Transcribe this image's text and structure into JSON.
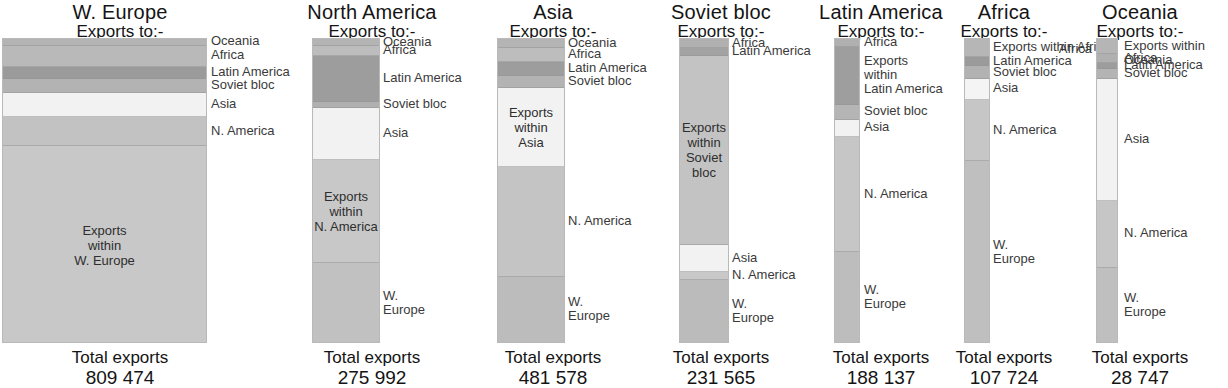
{
  "figure": {
    "subtitle_text": "Exports to:-",
    "total_label": "Total exports"
  },
  "chart_data": {
    "type": "bar",
    "subtitle": "Exports to:-",
    "xlabel": "",
    "ylabel": "",
    "stacked": true,
    "normalized": true,
    "legend": "inline-callouts",
    "grid": false,
    "categories": [
      "W. Europe",
      "North America",
      "Asia",
      "Soviet bloc",
      "Latin America",
      "Africa",
      "Oceania"
    ],
    "totals": [
      809474,
      275992,
      481578,
      231565,
      188137,
      107724,
      28747
    ],
    "totals_display": [
      "809 474",
      "275 992",
      "481 578",
      "231 565",
      "188 137",
      "107 724",
      "28 747"
    ],
    "destination_order": [
      "Oceania",
      "Africa",
      "Latin America",
      "Soviet bloc",
      "Asia",
      "N. America",
      "W. Europe"
    ],
    "colors": {
      "oceania": "#b0b0b0",
      "africa": "#b9b9b9",
      "latin_america": "#9a9a9a",
      "soviet_bloc": "#b5b5b5",
      "asia": "#f0f0f0",
      "n_america": "#c4c4c4",
      "w_europe": "#c0c0c0",
      "within": "#c8c8c8",
      "outline": "#b9b9b9",
      "text": "#141414"
    },
    "panels": [
      {
        "name": "W. Europe",
        "title": "W. Europe",
        "total": "809 474",
        "segments": [
          {
            "dest": "Oceania",
            "pct": 2.2,
            "color": "#b4b4b4",
            "callout": "Oceania",
            "side": "right",
            "inner": null
          },
          {
            "dest": "Africa",
            "pct": 7.0,
            "color": "#b9b9b9",
            "callout": "Africa",
            "side": "right",
            "inner": null
          },
          {
            "dest": "Latin America",
            "pct": 4.0,
            "color": "#9b9b9b",
            "callout": "Latin America",
            "side": "right",
            "inner": null
          },
          {
            "dest": "Soviet bloc",
            "pct": 4.5,
            "color": "#b3b3b3",
            "callout": "Soviet bloc",
            "side": "right",
            "inner": null
          },
          {
            "dest": "Asia",
            "pct": 8.0,
            "color": "#f2f2f2",
            "callout": "Asia",
            "side": "right",
            "inner": null
          },
          {
            "dest": "N. America",
            "pct": 9.5,
            "color": "#c2c2c2",
            "callout": "N. America",
            "side": "right",
            "inner": null
          },
          {
            "dest": "W. Europe",
            "pct": 64.8,
            "color": "#c8c8c8",
            "callout": null,
            "side": "right",
            "inner": "Exports\nwithin\nW. Europe"
          }
        ]
      },
      {
        "name": "North America",
        "title": "North America",
        "total": "275 992",
        "segments": [
          {
            "dest": "Oceania",
            "pct": 2.4,
            "color": "#b4b4b4",
            "callout": "Oceania",
            "side": "right",
            "inner": null
          },
          {
            "dest": "Africa",
            "pct": 3.2,
            "color": "#bdbdbd",
            "callout": "Africa",
            "side": "right",
            "inner": null
          },
          {
            "dest": "Latin America",
            "pct": 15.0,
            "color": "#9d9d9d",
            "callout": "Latin America",
            "side": "right",
            "inner": null
          },
          {
            "dest": "Soviet bloc",
            "pct": 2.0,
            "color": "#b0b0b0",
            "callout": "Soviet bloc",
            "side": "right",
            "inner": null
          },
          {
            "dest": "Asia",
            "pct": 17.0,
            "color": "#f2f2f2",
            "callout": "Asia",
            "side": "right",
            "inner": null
          },
          {
            "dest": "N. America",
            "pct": 34.0,
            "color": "#c8c8c8",
            "callout": null,
            "side": "right",
            "inner": "Exports\nwithin\nN. America"
          },
          {
            "dest": "W. Europe",
            "pct": 26.4,
            "color": "#c1c1c1",
            "callout": "W.\nEurope",
            "side": "right",
            "inner": null
          }
        ]
      },
      {
        "name": "Asia",
        "title": "Asia",
        "total": "481 578",
        "segments": [
          {
            "dest": "Oceania",
            "pct": 3.0,
            "color": "#b4b4b4",
            "callout": "Oceania",
            "side": "right",
            "inner": null
          },
          {
            "dest": "Africa",
            "pct": 4.5,
            "color": "#bdbdbd",
            "callout": "Africa",
            "side": "right",
            "inner": null
          },
          {
            "dest": "Latin America",
            "pct": 4.5,
            "color": "#9d9d9d",
            "callout": "Latin America",
            "side": "right",
            "inner": null
          },
          {
            "dest": "Soviet bloc",
            "pct": 4.0,
            "color": "#b3b3b3",
            "callout": "Soviet bloc",
            "side": "right",
            "inner": null
          },
          {
            "dest": "Asia",
            "pct": 26.0,
            "color": "#f2f2f2",
            "callout": null,
            "side": "right",
            "inner": "Exports\nwithin\nAsia"
          },
          {
            "dest": "N. America",
            "pct": 36.0,
            "color": "#c4c4c4",
            "callout": "N. America",
            "side": "right",
            "inner": null
          },
          {
            "dest": "W. Europe",
            "pct": 22.0,
            "color": "#bcbcbc",
            "callout": "W.\nEurope",
            "side": "right",
            "inner": null
          }
        ]
      },
      {
        "name": "Soviet bloc",
        "title": "Soviet bloc",
        "total": "231 565",
        "segments": [
          {
            "dest": "Africa",
            "pct": 3.0,
            "color": "#b0b0b0",
            "callout": "Africa",
            "side": "right",
            "inner": null
          },
          {
            "dest": "Latin America",
            "pct": 2.5,
            "color": "#a3a3a3",
            "callout": "Latin America",
            "side": "right",
            "inner": null
          },
          {
            "dest": "Soviet bloc",
            "pct": 62.0,
            "color": "#c3c3c3",
            "callout": null,
            "side": "right",
            "inner": "Exports\nwithin\nSoviet bloc"
          },
          {
            "dest": "Asia",
            "pct": 9.0,
            "color": "#f2f2f2",
            "callout": "Asia",
            "side": "right",
            "inner": null
          },
          {
            "dest": "N. America",
            "pct": 2.5,
            "color": "#c8c8c8",
            "callout": "N. America",
            "side": "right",
            "inner": null
          },
          {
            "dest": "W. Europe",
            "pct": 21.0,
            "color": "#bbbbbb",
            "callout": "W.\nEurope",
            "side": "right",
            "inner": null
          }
        ]
      },
      {
        "name": "Latin America",
        "title": "Latin America",
        "total": "188 137",
        "segments": [
          {
            "dest": "Africa",
            "pct": 2.5,
            "color": "#b0b0b0",
            "callout": "Africa",
            "side": "right",
            "inner": null
          },
          {
            "dest": "Latin America",
            "pct": 19.0,
            "color": "#9e9e9e",
            "callout": "Exports\nwithin\nLatin America",
            "side": "right",
            "inner": null
          },
          {
            "dest": "Soviet bloc",
            "pct": 5.0,
            "color": "#b5b5b5",
            "callout": "Soviet bloc",
            "side": "right",
            "inner": null
          },
          {
            "dest": "Asia",
            "pct": 5.5,
            "color": "#f2f2f2",
            "callout": "Asia",
            "side": "right",
            "inner": null
          },
          {
            "dest": "N. America",
            "pct": 38.0,
            "color": "#c6c6c6",
            "callout": "N. America",
            "side": "right",
            "inner": null
          },
          {
            "dest": "W. Europe",
            "pct": 30.0,
            "color": "#bdbdbd",
            "callout": "W.\nEurope",
            "side": "right",
            "inner": null
          }
        ]
      },
      {
        "name": "Africa",
        "title": "Africa",
        "total": "107 724",
        "segments": [
          {
            "dest": "Africa",
            "pct": 6.0,
            "color": "#b6b6b6",
            "callout": "Exports within Africa",
            "side": "right",
            "inner": null
          },
          {
            "dest": "Latin America",
            "pct": 3.0,
            "color": "#9b9b9b",
            "callout": "Latin America",
            "side": "right",
            "inner": null
          },
          {
            "dest": "Soviet bloc",
            "pct": 4.0,
            "color": "#b2b2b2",
            "callout": "Soviet bloc",
            "side": "right",
            "inner": null
          },
          {
            "dest": "Asia",
            "pct": 7.0,
            "color": "#f4f4f4",
            "callout": "Asia",
            "side": "right",
            "inner": null
          },
          {
            "dest": "N. America",
            "pct": 20.0,
            "color": "#c6c6c6",
            "callout": "N. America",
            "side": "right",
            "inner": null
          },
          {
            "dest": "W. Europe",
            "pct": 60.0,
            "color": "#bfbfbf",
            "callout": "W.\nEurope",
            "side": "right",
            "inner": null
          }
        ]
      },
      {
        "name": "Oceania",
        "title": "Oceania",
        "total": "28 747",
        "segments": [
          {
            "dest": "Oceania",
            "pct": 5.0,
            "color": "#b5b5b5",
            "callout": "Exports within Oceania",
            "side": "right",
            "inner": null
          },
          {
            "dest": "Africa",
            "pct": 3.0,
            "color": "#b0b0b0",
            "callout": "Africa",
            "side": "right",
            "inner": null
          },
          {
            "dest": "Latin America",
            "pct": 2.0,
            "color": "#9d9d9d",
            "callout": "Latin America",
            "side": "right",
            "inner": null
          },
          {
            "dest": "Soviet bloc",
            "pct": 3.0,
            "color": "#b4b4b4",
            "callout": "Soviet bloc",
            "side": "right",
            "inner": null
          },
          {
            "dest": "Asia",
            "pct": 40.0,
            "color": "#f2f2f2",
            "callout": "Asia",
            "side": "right",
            "inner": null
          },
          {
            "dest": "N. America",
            "pct": 22.0,
            "color": "#c6c6c6",
            "callout": "N. America",
            "side": "right",
            "inner": null
          },
          {
            "dest": "W. Europe",
            "pct": 25.0,
            "color": "#bfbfbf",
            "callout": "W.\nEurope",
            "side": "right",
            "inner": null
          }
        ]
      }
    ],
    "extra_callouts": [
      {
        "panel": "Oceania",
        "text": "Africa",
        "side": "left"
      }
    ]
  }
}
